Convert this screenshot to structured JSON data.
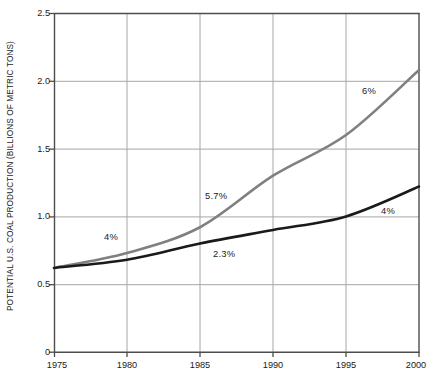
{
  "chart_data": {
    "type": "line",
    "title": "",
    "subtitle": "",
    "xlabel": "",
    "ylabel": "POTENTIAL U.S. COAL PRODUCTION (BILLIONS OF METRIC TONS)",
    "x": [
      1975,
      1980,
      1985,
      1990,
      1995,
      2000
    ],
    "xtick_labels": [
      "1975",
      "1980",
      "1985",
      "1990",
      "1995",
      "2000"
    ],
    "ytick_labels": [
      "0",
      "0.5",
      "1.0",
      "1.5",
      "2.0",
      "2.5"
    ],
    "ytick_values": [
      0,
      0.5,
      1.0,
      1.5,
      2.0,
      2.5
    ],
    "xlim": [
      1975,
      2000
    ],
    "ylim": [
      0,
      2.5
    ],
    "grid": "both",
    "legend_position": "none",
    "series": [
      {
        "name": "high-growth-case",
        "color": "#808080",
        "values": [
          0.62,
          0.73,
          0.92,
          1.3,
          1.6,
          2.08
        ]
      },
      {
        "name": "low-growth-case",
        "color": "#1a1a1a",
        "values": [
          0.62,
          0.68,
          0.8,
          0.9,
          1.0,
          1.22
        ]
      }
    ],
    "annotations": [
      {
        "text": "4%",
        "x": 104,
        "y": 232
      },
      {
        "text": "5.7%",
        "x": 205,
        "y": 191
      },
      {
        "text": "2.3%",
        "x": 213,
        "y": 249
      },
      {
        "text": "6%",
        "x": 362,
        "y": 86
      },
      {
        "text": "4%",
        "x": 381,
        "y": 206
      }
    ],
    "plot_area": {
      "left": 54,
      "top": 13,
      "right": 419,
      "bottom": 352
    },
    "colors": {
      "axis": "#4d4d4d",
      "grid": "#a6a6a6",
      "background": "#ffffff",
      "text": "#1a1a1a"
    }
  }
}
